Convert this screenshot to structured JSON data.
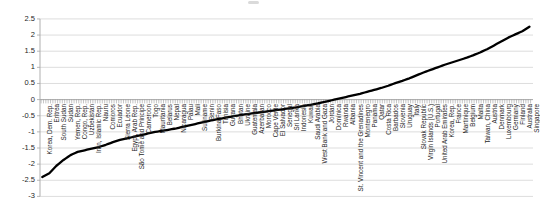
{
  "chart_data": {
    "type": "line",
    "title": "",
    "xlabel": "",
    "ylabel": "",
    "ylim": [
      -3,
      2.5
    ],
    "ytick_step": 0.5,
    "ytick_labels": [
      "2.5",
      "2",
      "1.5",
      "1",
      "0.5",
      "0",
      "-0.5",
      "-1",
      "-1.5",
      "-2",
      "-2.5",
      "-3"
    ],
    "legend": "none",
    "grid": "horizontal",
    "line_color": "#000000",
    "gridline_color": "#d9d9d9",
    "axis_color": "#a6a6a6",
    "tick_color": "#8c8c8c",
    "label_color": "#262626",
    "points_between_labels": 2,
    "categories": [
      "Korea, Dem. Rep.",
      "Eritrea",
      "South Sudan",
      "Sudan",
      "Yemen, Rep.",
      "Congo, Rep.",
      "Uzbekistan",
      "Iran, Islamic Rep.",
      "Nauru",
      "Comoros",
      "Ecuador",
      "Sierra Leone",
      "Egypt, Arab Rep.",
      "São Tomé and Príncipe",
      "Cameroon",
      "Togo",
      "Mauritania",
      "Belarus",
      "Nepal",
      "Nicaragua",
      "Palau",
      "Mali",
      "Suriname",
      "Benin",
      "Burkina Faso",
      "Tunisia",
      "Guyana",
      "Bhutan",
      "Ukraine",
      "Guatemala",
      "Azerbaijan",
      "Morocco",
      "Cape Verde",
      "El Salvador",
      "Senegal",
      "Sri Lanka",
      "Indonesia",
      "Kuwait",
      "Saudi Arabia",
      "West Bank and Gaza",
      "Jordan",
      "Dominica",
      "Rwanda",
      "Albania",
      "St. Vincent and the Grenadines",
      "Montenegro",
      "Panama",
      "Qatar",
      "Costa Rica",
      "Barbados",
      "Slovenia",
      "Uruguay",
      "Italy",
      "Slovak Republic",
      "Virgin Islands (U.S.)",
      "Portugal",
      "United Arab Emirates",
      "Korea, Rep.",
      "France",
      "Martinique",
      "Belgium",
      "Malta",
      "Taiwan, China",
      "Austria",
      "Denmark",
      "Luxembourg",
      "Germany",
      "Finland",
      "Australia",
      "Singapore"
    ],
    "values": [
      -2.4,
      -2.28,
      -2.05,
      -1.87,
      -1.72,
      -1.62,
      -1.57,
      -1.52,
      -1.47,
      -1.4,
      -1.32,
      -1.25,
      -1.2,
      -1.15,
      -1.1,
      -1.05,
      -1.0,
      -0.97,
      -0.93,
      -0.89,
      -0.84,
      -0.79,
      -0.74,
      -0.69,
      -0.64,
      -0.6,
      -0.56,
      -0.52,
      -0.48,
      -0.45,
      -0.42,
      -0.39,
      -0.36,
      -0.33,
      -0.3,
      -0.27,
      -0.24,
      -0.2,
      -0.16,
      -0.12,
      -0.07,
      -0.02,
      0.03,
      0.08,
      0.13,
      0.18,
      0.24,
      0.3,
      0.36,
      0.43,
      0.51,
      0.58,
      0.66,
      0.75,
      0.84,
      0.92,
      1.0,
      1.08,
      1.15,
      1.22,
      1.29,
      1.37,
      1.46,
      1.56,
      1.68,
      1.8,
      1.92,
      2.02,
      2.12,
      2.26
    ]
  }
}
